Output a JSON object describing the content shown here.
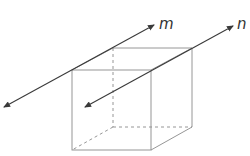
{
  "diagram": {
    "type": "cube-with-lines",
    "colors": {
      "edge": "#8a8a8a",
      "line": "#3a3a3a",
      "label": "#333333",
      "background": "#ffffff"
    },
    "lines": [
      {
        "id": "m",
        "label": "m"
      },
      {
        "id": "n",
        "label": "n"
      }
    ]
  }
}
